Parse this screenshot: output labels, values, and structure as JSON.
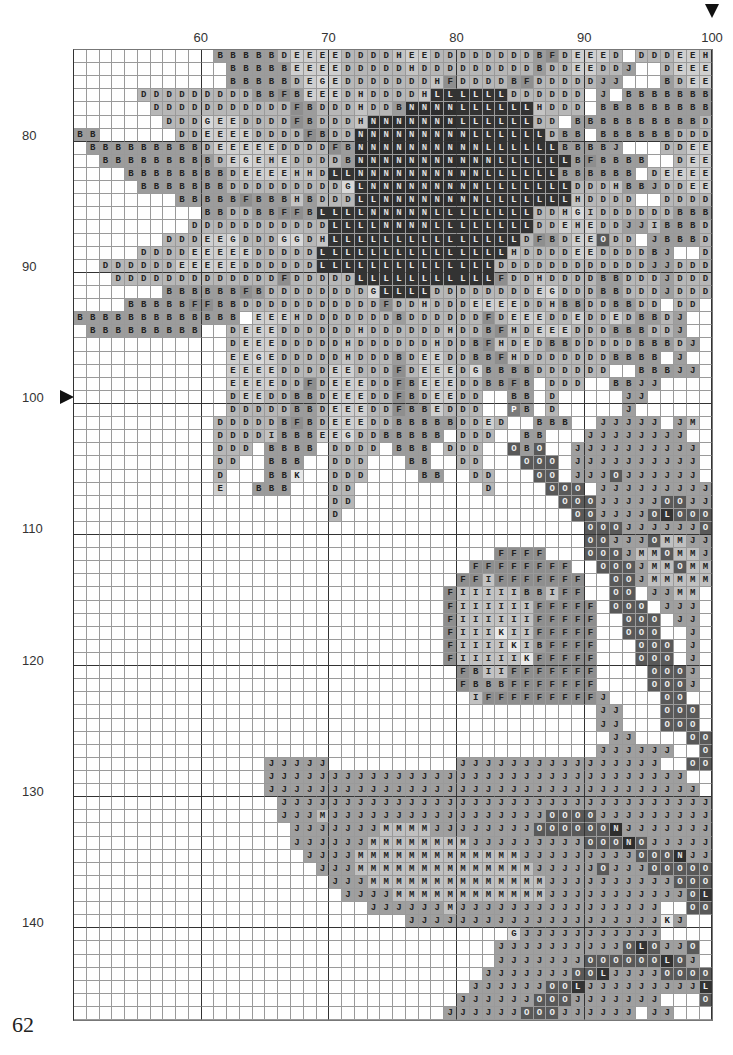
{
  "page": {
    "number": "62"
  },
  "chart": {
    "first_col": 50,
    "first_row": 74,
    "cols": 50,
    "rows": 73,
    "col_labels": [
      {
        "value": "60",
        "col": 60
      },
      {
        "value": "70",
        "col": 70
      },
      {
        "value": "80",
        "col": 80
      },
      {
        "value": "90",
        "col": 90
      },
      {
        "value": "100",
        "col": 100
      }
    ],
    "row_labels": [
      {
        "value": "80",
        "row": 80
      },
      {
        "value": "90",
        "row": 90
      },
      {
        "value": "100",
        "row": 100
      },
      {
        "value": "110",
        "row": 110
      },
      {
        "value": "120",
        "row": 120
      },
      {
        "value": "130",
        "row": 130
      },
      {
        "value": "140",
        "row": 140
      }
    ],
    "center_markers": {
      "top_col": 100,
      "left_row": 100
    }
  },
  "symbols": {
    "B": {
      "bg": "#9c9c9c",
      "fg": "#222"
    },
    "D": {
      "bg": "#b7b7b7",
      "fg": "#222"
    },
    "E": {
      "bg": "#cfcfcf",
      "fg": "#222"
    },
    "F": {
      "bg": "#8e8e8e",
      "fg": "#222"
    },
    "G": {
      "bg": "#d8d8d8",
      "fg": "#222"
    },
    "H": {
      "bg": "#c4c4c4",
      "fg": "#222"
    },
    "I": {
      "bg": "#c2c2c2",
      "fg": "#222"
    },
    "J": {
      "bg": "#9f9f9f",
      "fg": "#222"
    },
    "K": {
      "bg": "#e8e8e8",
      "fg": "#222"
    },
    "L": {
      "bg": "#333333",
      "fg": "#eee"
    },
    "M": {
      "bg": "#c0c0c0",
      "fg": "#222"
    },
    "N": {
      "bg": "#2e2e2e",
      "fg": "#ddd"
    },
    "O": {
      "bg": "#595959",
      "fg": "#eee"
    },
    "P": {
      "bg": "#7a7a7a",
      "fg": "#fff"
    }
  },
  "grid_rows": [
    "           BBBBBDEEEEDDDDHEEDDDDDDDDBFDEEED DDDEEHHHH",
    "            BBBBBEEEEDDDDDHDDDDDDDDDBDDEEDDJ  DEEEGED",
    "            BBBBBDEGEDDDDDDDHFDDDDBFDDDDDJJ   BDEEDD",
    "     DDDDDDDDDBBFBEEEDHDDDDHLLLLLLDDDDDD J BBBBBBBBB",
    "      DDDDDDDDDDDFBDDDHDDBNNNNLLLLLLHDDD BBBBBBBBBB",
    "       DDDGEEDDDDFBDDDHNNNNNNNLLLLLLDD BBBBBBBBBBDD",
    "BB      DDEEEEDDDDFBDDNNNNNNNNNLLLLLLDBB BBBBBBDDDD",
    " BBBBBBBBBDEEEEEDDDDFBNNNNNNNNNNLLLLLLBBBBJ   DDEEE",
    "  BBBBBBBBBDEGEHEDDDDBNNNNNNNNNNNLLLLLLBFBBBB  DEEEE",
    "    BBBBBBBBDEEEEHHDLLNNNNNNNNNNLLLLLLBBBBBB DEEEEE",
    "     BBBBBBBDDDDDDDDDGLNNNNNNNNNLLLLLLLDDDHBBJDDEEEEB",
    "        BBBBBFBBBHBDDDLLNNNNNNNNLLLLLLLHDDDD  DDDDDBB",
    "          BBDDBBFFBLLLLNNNNNLLLLLLLLDDHGIDDDDDDBBBD",
    "         DDDDDDDDDDDLLLLNNNNLLLLLLLLDDEHEDDJJIBBBDD",
    "       DDDEEGDDDGGDHLLLLLLLLLLLLLLLDFBDEEODD JBBBDDE",
    "     DDDDEEEEEDDDDDLLLLLLLLLLLLLLLHDDDDEEDDDDBJ  DDEE",
    "  DDDDDDEEEEEDDDDDDLLLLLLLLLLLLLLDDDDDDDDDDDDJJDDDEG",
    "   DDDDDDDDDDDDDFDDDDDLLLLLLLLLLLFDDHDDDDBBDDDJDDDDEE",
    "       BBBBBBFBDDDDDDDDGLLLLDDDDDDDDEGDDDBBDDDJDDDDDD",
    "    BBBBBFFBBDDDDDDDDDDDFDDHDDDEEEEDDHBBDDBBDD DD",
    "BBBBBBBBBBBBB EEEHDDDDDDDBDDDDDDFDEEEDDEDDEDBBDJ  BB",
    " BBBBBBBBB  DEEEDDDDDDHDDDDDDHDDBFHDEEEDDDBBBDDJ   B",
    "            DEEEDDDDDHDDDDDDHDDBFHDEDBBDDDDDBBBDJ   BB",
    "            EEGEDDDDDHDDDBDEEDDBBFHDDDDDDDBBBB J",
    "            EEEEDDDDEEDDDFDEEEDGBBBBDDDDDD  BBBJJ",
    "            EEEEDDFDEEEDDFBEEEDDBBFB DDD  BBJJ",
    "            DEEDDBBDEEEDDFBDEEDD  BB D     JJ",
    "            DDDDDBBDEEEDDFBBEDDD  PB D     J",
    "           DDDDDBFBDEEEDDBBBBBDDED  BBB  JJJJJ JM",
    "           DDDDIBBBEEGDDBBBBB DDD  BB   JJJJJJJJ",
    "           DDD BBBB DDDD BBB DDD  OBO  JJJJJJJJJJ",
    "           DD  BBB  DDD   BB  DD   OOO JJJJJJJJJJ",
    "           D   BBK  DDD    BB  DD   OO JJJOJJJJJJ",
    "           E  BBB   DD          D    OOO JJJJJJJJJ",
    "                    DD                OOOJJJJJOOJJ",
    "                    D                  OOJJJJOLOOO",
    "                                        OOOJJJJJJOO",
    "                                        OOJJJOMMJJ",
    "                                 FFFF   OOOJMMOMMJ",
    "                               FFFFFFFF  OOOJMMOMM",
    "                              FFIFFFFFFF  OOJMMMMM",
    "                             FIIIIIBBIFF  OO JJMM",
    "                             FIIIIIIFFFFF OOO JJJ",
    "                             FIIIIIIFFFFF  OOO JJ",
    "                             FIIIKIIFFFFF  OOO  J",
    "                             FIIIIKIBFFFF   OOO J",
    "                             FIIIIIKFFFFF   OOO J",
    "                              FBIIFFFFFFF    OOOJ",
    "                              FBBBFFFFFFF    OOOJ",
    "                               IFFFFFFFFFJ    OO ",
    "                                         JJ   OOO",
    "                                         JJ   OOO",
    "                                          JJ    OO",
    "                                         JJJJJJ  OO",
    "               JJJJJ          JJJJJJJJJJJJJJJJ  OO",
    "               JJJJJJJJJJJJJJJJJJJJJJJJJJJJJJJJJ  OO",
    "               JJJJJJJJJJJJJJJJJJJJJJJJJJJJJJJJJJ  O",
    "                JJJJJJJJJJJJJJJJJJJJJJJJJJJJJJJJJJ O",
    "                JJJMJJJJJJJJJJJJJJJJJOOOOJJJJJJJJJ",
    "                 JJJJJJJMMMMJJJJJJJJOOOOOONJJJJJJJJ",
    "                 JJJJJJMMMMMMMMJJJJJJJJJOOONOJJJJJJ",
    "                  JJJJMMMMMMMMMMMMMJJJJJJJJJOOONJJJ",
    "                   JJJMMMMMMMMMMMMMMJJJJJOJJJOOOOOJJ",
    "                    JJJMMMMMMMMMMMMMMJJJJJJJJJJOOO",
    "                     JJJJMMMMMMMMMMMMJJJJJJJJJJJOLO",
    "                       JJJJJJMJJJJJJJJJJJJJJJJ  OOO",
    "                          JJJJJJJJJJJJJJJJJJJJKJ   OL",
    "                                  GJJJJJJJJJJJ    O",
    "                                 JJJJJJJJJJOLOJJO",
    "                                 JJJJJJJOOOOOOLOJ",
    "                                JJJJJJJOOLJJJJOOOO",
    "                               JJJJJJOOLJJJJJJJJJL",
    "                              JJJJJJOOOJJJJJJJ   O",
    "                             JJJJJJOOOJJJJJJ JJ   "
  ]
}
